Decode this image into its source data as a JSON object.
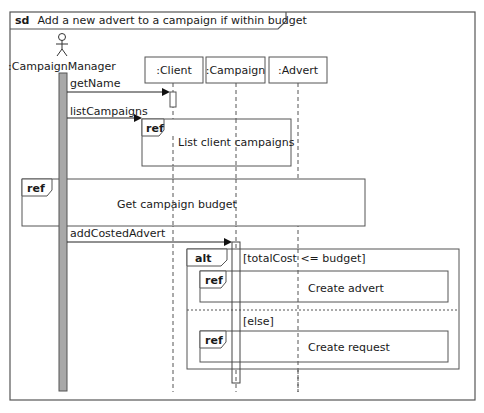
{
  "diagram": {
    "type": "sequence",
    "frame": {
      "keyword": "sd",
      "title": "Add a new advert to a campaign if within budget"
    },
    "actor": {
      "name": ":CampaignManager"
    },
    "lifelines": [
      {
        "name": ":Client"
      },
      {
        "name": ":Campaign"
      },
      {
        "name": ":Advert"
      }
    ],
    "messages": [
      {
        "label": "getName",
        "from": ":CampaignManager",
        "to": ":Client"
      },
      {
        "label": "listCampaigns",
        "from": ":CampaignManager",
        "to": "ref: List client campaigns"
      },
      {
        "label": "addCostedAdvert",
        "from": ":CampaignManager",
        "to": ":Campaign"
      }
    ],
    "refs": {
      "list_client_campaigns": {
        "keyword": "ref",
        "text": "List client  campaigns"
      },
      "get_campaign_budget": {
        "keyword": "ref",
        "text": "Get campaign budget"
      },
      "create_advert": {
        "keyword": "ref",
        "text": "Create advert"
      },
      "create_request": {
        "keyword": "ref",
        "text": "Create request"
      }
    },
    "alt": {
      "keyword": "alt",
      "guard1": "[totalCost <= budget]",
      "guard2": "[else]"
    }
  }
}
